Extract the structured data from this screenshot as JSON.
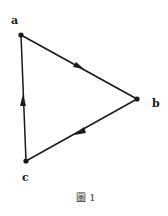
{
  "diagram": {
    "type": "directed-graph",
    "nodes": [
      {
        "id": "a",
        "label": "a",
        "x": 21,
        "y": 35
      },
      {
        "id": "b",
        "label": "b",
        "x": 137,
        "y": 99
      },
      {
        "id": "c",
        "label": "c",
        "x": 26,
        "y": 161
      }
    ],
    "edges": [
      {
        "from": "a",
        "to": "b"
      },
      {
        "from": "b",
        "to": "c"
      },
      {
        "from": "c",
        "to": "a"
      }
    ],
    "caption": "圖 1"
  },
  "colors": {
    "stroke": "#1a1a1a",
    "background": "#ffffff"
  }
}
